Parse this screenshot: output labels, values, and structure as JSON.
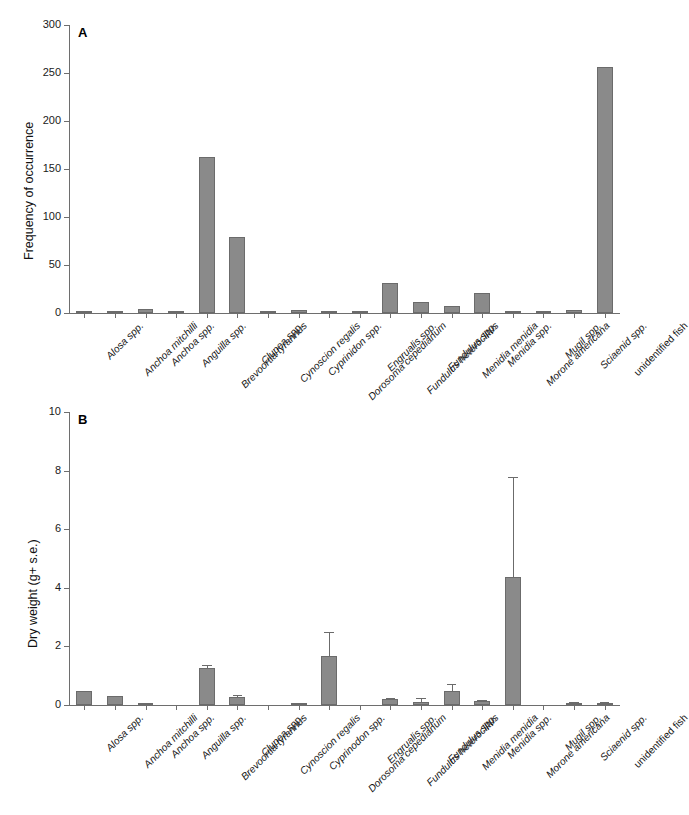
{
  "figure": {
    "background": "#ffffff",
    "bar_color": "#8a8a8a",
    "axis_color": "#6e6e6e"
  },
  "panelA": {
    "letter": "A",
    "ylabel": "Frequency of occurrence",
    "yticks": [
      "0",
      "50",
      "100",
      "150",
      "200",
      "250",
      "300"
    ]
  },
  "panelB": {
    "letter": "B",
    "ylabel": "Dry weight (g+ s.e.)",
    "yticks": [
      "0",
      "2",
      "4",
      "6",
      "8",
      "10"
    ]
  },
  "chart_data": [
    {
      "type": "bar",
      "panel": "A",
      "title": "",
      "xlabel": "",
      "ylabel": "Frequency of occurrence",
      "ylim": [
        0,
        300
      ],
      "ytick_step": 50,
      "grid": false,
      "legend": "none",
      "categories": [
        "Alosa spp.",
        "Anchoa mitchilli",
        "Anchoa spp.",
        "Anguilla spp.",
        "Brevoortia tyrannus",
        "Clupea spp.",
        "Cynoscion regalis",
        "Cyprinidon spp.",
        "Dorosoma cepedianum",
        "Engrualis spp.",
        "Fundulus heteroclitus",
        "Fundulus spp.",
        "Menidia menidia",
        "Menidia spp.",
        "Morone americana",
        "Mugil spp.",
        "Sciaenid spp.",
        "unidentified fish"
      ],
      "values": [
        1,
        1,
        4,
        1,
        162,
        79,
        1,
        3,
        2,
        1,
        31,
        11,
        7,
        21,
        1,
        0.5,
        3,
        256
      ]
    },
    {
      "type": "bar",
      "panel": "B",
      "title": "",
      "xlabel": "",
      "ylabel": "Dry weight (g+ s.e.)",
      "ylim": [
        0,
        10
      ],
      "ytick_step": 2,
      "grid": false,
      "legend": "none",
      "categories": [
        "Alosa spp.",
        "Anchoa mitchilli",
        "Anchoa spp.",
        "Anguilla spp.",
        "Brevoortia tyrannus",
        "Clupea spp.",
        "Cynoscion regalis",
        "Cyprinodon spp.",
        "Dorosoma cepedianum",
        "Engrualis spp.",
        "Fundulus heteroclitus",
        "Fundulus spp.",
        "Menidia menidia",
        "Menidia spp.",
        "Morone americana",
        "Mugil spp.",
        "Sciaenid spp.",
        "unidentified fish"
      ],
      "values": [
        0.47,
        0.31,
        0.04,
        0.0,
        1.25,
        0.27,
        0.0,
        0.03,
        1.67,
        0.0,
        0.2,
        0.1,
        0.48,
        0.15,
        4.37,
        0.0,
        0.04,
        0.05
      ],
      "errors": [
        0.0,
        0.0,
        0.02,
        0.0,
        0.1,
        0.07,
        0.0,
        0.02,
        0.82,
        0.0,
        0.05,
        0.13,
        0.22,
        0.03,
        3.4,
        0.0,
        0.07,
        0.05
      ]
    }
  ],
  "xlabels_italic": [
    true,
    true,
    true,
    true,
    true,
    true,
    true,
    true,
    true,
    true,
    true,
    true,
    true,
    true,
    true,
    true,
    true,
    false
  ]
}
